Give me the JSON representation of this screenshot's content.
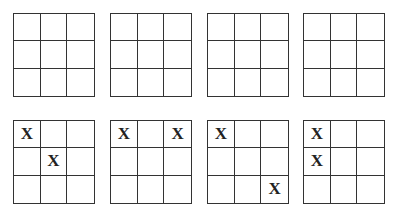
{
  "boards": [
    {
      "cells": [
        "",
        "",
        "",
        "",
        "",
        "",
        "",
        "",
        ""
      ]
    },
    {
      "cells": [
        "",
        "",
        "",
        "",
        "",
        "",
        "",
        "",
        ""
      ]
    },
    {
      "cells": [
        "",
        "",
        "",
        "",
        "",
        "",
        "",
        "",
        ""
      ]
    },
    {
      "cells": [
        "",
        "",
        "",
        "",
        "",
        "",
        "",
        "",
        ""
      ]
    },
    {
      "cells": [
        "X",
        "",
        "",
        "",
        "X",
        "",
        "",
        "",
        ""
      ]
    },
    {
      "cells": [
        "X",
        "",
        "X",
        "",
        "",
        "",
        "",
        "",
        ""
      ]
    },
    {
      "cells": [
        "X",
        "",
        "",
        "",
        "",
        "",
        "",
        "",
        "X"
      ]
    },
    {
      "cells": [
        "X",
        "",
        "",
        "X",
        "",
        "",
        "",
        "",
        ""
      ]
    }
  ]
}
